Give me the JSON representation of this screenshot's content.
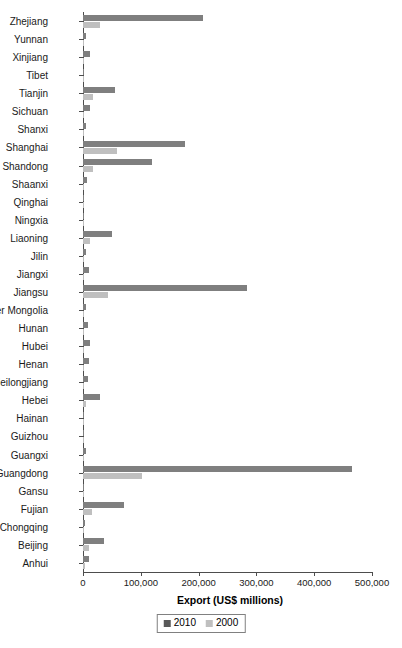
{
  "chart_data": {
    "type": "bar",
    "orientation": "horizontal",
    "title": "",
    "xlabel": "Export (US$ millions)",
    "ylabel": "",
    "xlim": [
      0,
      500000
    ],
    "xticks": [
      0,
      100000,
      200000,
      300000,
      400000,
      500000
    ],
    "xtick_labels": [
      "0",
      "100,000",
      "200,000",
      "300,000",
      "400,000",
      "500,000"
    ],
    "grid": false,
    "legend_position": "bottom",
    "colors": {
      "2010": "#7f7f7f",
      "2000": "#bfbfbf"
    },
    "categories": [
      "Zhejiang",
      "Yunnan",
      "Xinjiang",
      "Tibet",
      "Tianjin",
      "Sichuan",
      "Shanxi",
      "Shanghai",
      "Shandong",
      "Shaanxi",
      "Qinghai",
      "Ningxia",
      "Liaoning",
      "Jilin",
      "Jiangxi",
      "Jiangsu",
      "Inner Mongolia",
      "Hunan",
      "Hubei",
      "Henan",
      "Heilongjiang",
      "Hebei",
      "Hainan",
      "Guizhou",
      "Guangxi",
      "Guangdong",
      "Gansu",
      "Fujian",
      "Chongqing",
      "Beijing",
      "Anhui"
    ],
    "series": [
      {
        "name": "2010",
        "color": "#7f7f7f",
        "values": [
          207600,
          5000,
          12000,
          500,
          55000,
          12000,
          6000,
          176000,
          119000,
          7000,
          500,
          500,
          50000,
          6000,
          11000,
          284000,
          5000,
          8000,
          12000,
          11000,
          9000,
          30000,
          1500,
          1500,
          6000,
          465000,
          1000,
          71000,
          4000,
          36000,
          11000
        ]
      },
      {
        "name": "2000",
        "color": "#bfbfbf",
        "values": [
          30000,
          2000,
          1500,
          200,
          18000,
          2500,
          1500,
          58000,
          18000,
          1500,
          200,
          200,
          12000,
          1500,
          2000,
          43000,
          1500,
          2000,
          2000,
          2000,
          2000,
          6000,
          500,
          500,
          1500,
          102000,
          400,
          15000,
          1000,
          11000,
          3000
        ]
      }
    ]
  },
  "legend": {
    "items": [
      {
        "label": "2010",
        "swatch": "2010"
      },
      {
        "label": "2000",
        "swatch": "2000"
      }
    ]
  }
}
